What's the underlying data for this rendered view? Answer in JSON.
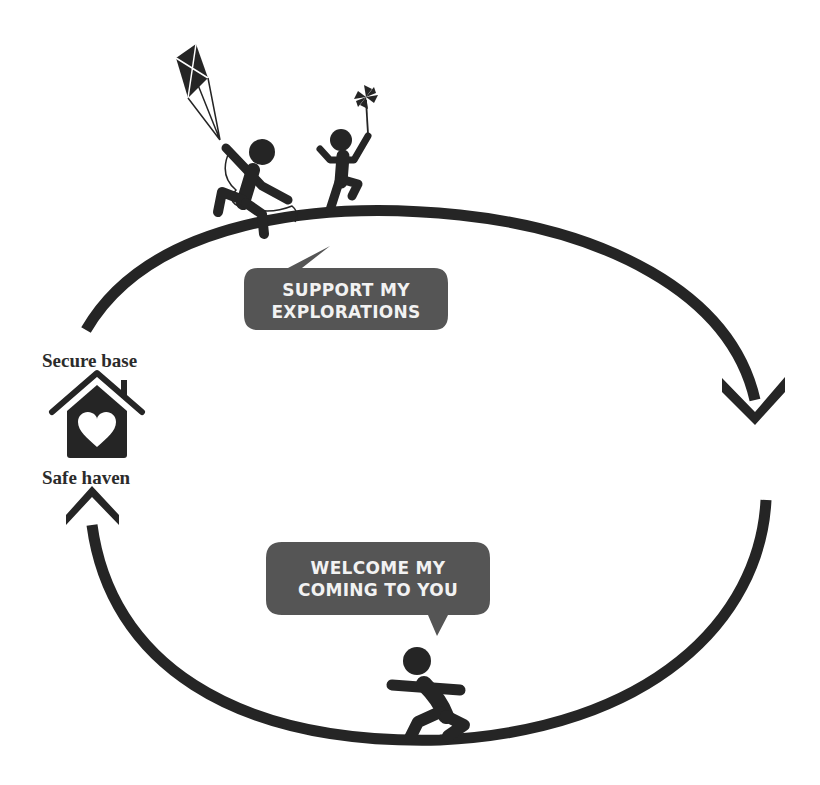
{
  "diagram": {
    "colors": {
      "ink": "#252525",
      "bubble": "#555555",
      "bubble_text": "#f2f2f2",
      "background": "#ffffff"
    },
    "home": {
      "top_label": "Secure base",
      "bottom_label": "Safe haven",
      "icon": "house-heart-icon"
    },
    "top_bubble": {
      "line1": "SUPPORT MY",
      "line2": "EXPLORATIONS"
    },
    "bottom_bubble": {
      "line1": "WELCOME MY",
      "line2": "COMING TO YOU"
    },
    "figures": [
      {
        "name": "child-with-kite",
        "icon": "kite-child-icon"
      },
      {
        "name": "child-with-pinwheel",
        "icon": "pinwheel-child-icon"
      },
      {
        "name": "child-running-back",
        "icon": "running-child-icon"
      }
    ],
    "arrows": [
      {
        "name": "top-arc",
        "direction": "clockwise, from secure base over top to right"
      },
      {
        "name": "bottom-arc",
        "direction": "from right down around bottom back to safe haven"
      }
    ]
  }
}
